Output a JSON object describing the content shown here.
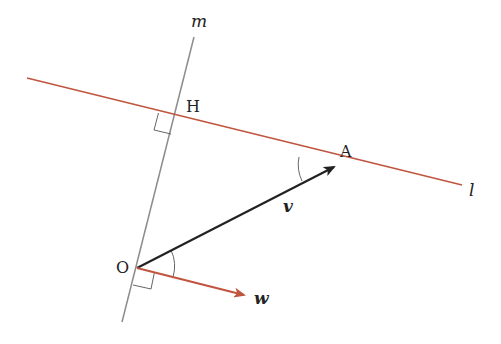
{
  "diagram": {
    "type": "geometry",
    "colors": {
      "line_l": "#c0553f",
      "line_m": "#8c8c8c",
      "vector_v": "#222222",
      "vector_w": "#c0553f",
      "marks": "#666666",
      "text": "#222222"
    },
    "lines": {
      "l": {
        "label": "l",
        "from": [
          27,
          78
        ],
        "to": [
          462,
          185
        ]
      },
      "m": {
        "label": "m",
        "from": [
          194,
          37
        ],
        "to": [
          122,
          322
        ]
      }
    },
    "points": {
      "O": {
        "label": "O",
        "pos": [
          137,
          268
        ]
      },
      "H": {
        "label": "H",
        "pos": [
          175,
          117
        ]
      },
      "A": {
        "label": "A",
        "pos": [
          336,
          166
        ]
      }
    },
    "vectors": {
      "v": {
        "label": "v",
        "from": "O",
        "to": "A"
      },
      "w": {
        "label": "w",
        "from": "O",
        "tip": [
          246,
          296
        ]
      }
    },
    "marks": {
      "right_angle_H": "right angle between line m and line l at H",
      "right_angle_O": "right angle between line m and vector w at O",
      "angle_O": "angle between v and w at O",
      "angle_A": "angle between line l and vector v at A"
    }
  }
}
